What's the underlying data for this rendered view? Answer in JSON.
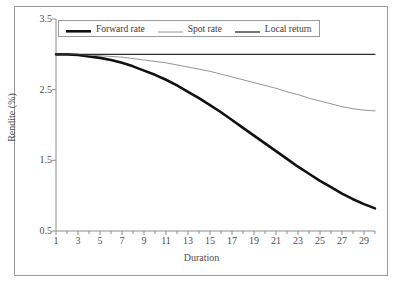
{
  "figure": {
    "top_clipped_text": "",
    "background": "#ffffff",
    "frame_color": "#9a9a9a"
  },
  "chart_data": {
    "type": "line",
    "title": "",
    "xlabel": "Duration",
    "ylabel": "Rendite (%)",
    "xlim": [
      1,
      30
    ],
    "ylim": [
      0.5,
      3.5
    ],
    "grid": false,
    "legend_position": "top-inside",
    "ytick_labels": [
      "3.5",
      "2.5",
      "1.5",
      "0.5"
    ],
    "yticks": [
      3.5,
      2.5,
      1.5,
      0.5
    ],
    "xtick_labels": [
      "1",
      "3",
      "5",
      "7",
      "9",
      "11",
      "13",
      "15",
      "17",
      "19",
      "21",
      "23",
      "25",
      "27",
      "29"
    ],
    "xticks": [
      1,
      3,
      5,
      7,
      9,
      11,
      13,
      15,
      17,
      19,
      21,
      23,
      25,
      27,
      29
    ],
    "xticks_minor": [
      2,
      4,
      6,
      8,
      10,
      12,
      14,
      16,
      18,
      20,
      22,
      24,
      26,
      28,
      30
    ],
    "x": [
      1,
      2,
      3,
      4,
      5,
      6,
      7,
      8,
      9,
      10,
      11,
      12,
      13,
      14,
      15,
      16,
      17,
      18,
      19,
      20,
      21,
      22,
      23,
      24,
      25,
      26,
      27,
      28,
      29,
      30
    ],
    "series": [
      {
        "name": "Forward rate",
        "color": "#111111",
        "width": 2.6,
        "style": "solid",
        "values": [
          3.0,
          3.0,
          2.99,
          2.97,
          2.95,
          2.92,
          2.88,
          2.83,
          2.77,
          2.71,
          2.64,
          2.56,
          2.47,
          2.38,
          2.28,
          2.18,
          2.07,
          1.96,
          1.85,
          1.74,
          1.63,
          1.52,
          1.41,
          1.31,
          1.21,
          1.12,
          1.03,
          0.95,
          0.88,
          0.82
        ]
      },
      {
        "name": "Spot rate",
        "color": "#8a8a8a",
        "width": 0.9,
        "style": "solid",
        "values": [
          3.0,
          3.0,
          3.0,
          2.99,
          2.98,
          2.97,
          2.96,
          2.94,
          2.92,
          2.9,
          2.88,
          2.85,
          2.82,
          2.79,
          2.76,
          2.72,
          2.68,
          2.64,
          2.6,
          2.56,
          2.52,
          2.47,
          2.43,
          2.38,
          2.34,
          2.3,
          2.26,
          2.23,
          2.21,
          2.2
        ]
      },
      {
        "name": "Local return",
        "color": "#2b2b2b",
        "width": 1.3,
        "style": "solid",
        "values": [
          3.0,
          3.0,
          3.0,
          3.0,
          3.0,
          3.0,
          3.0,
          3.0,
          3.0,
          3.0,
          3.0,
          3.0,
          3.0,
          3.0,
          3.0,
          3.0,
          3.0,
          3.0,
          3.0,
          3.0,
          3.0,
          3.0,
          3.0,
          3.0,
          3.0,
          3.0,
          3.0,
          3.0,
          3.0,
          3.0
        ]
      }
    ]
  }
}
